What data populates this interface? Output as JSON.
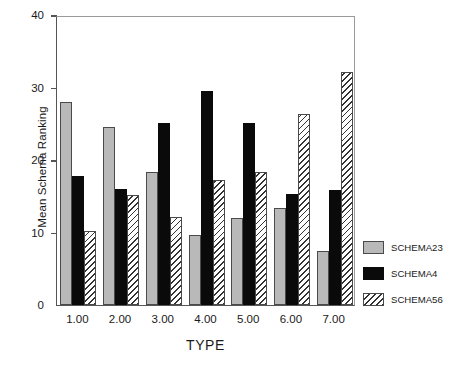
{
  "chart_data": {
    "type": "bar",
    "title": "",
    "xlabel": "TYPE",
    "ylabel": "Mean Schema Ranking",
    "categories": [
      "1.00",
      "2.00",
      "3.00",
      "4.00",
      "5.00",
      "6.00",
      "7.00"
    ],
    "ylim": [
      0,
      40
    ],
    "yticks": [
      0,
      10,
      20,
      30,
      40
    ],
    "ytick_labels": [
      "0",
      "10",
      "20",
      "30",
      "40"
    ],
    "grid": false,
    "legend_position": "right",
    "series": [
      {
        "name": "SCHEMA23",
        "color": "#b9b9b9",
        "fill": "solid-gray",
        "values": [
          28.0,
          24.6,
          18.3,
          9.6,
          12.0,
          13.4,
          7.4
        ]
      },
      {
        "name": "SCHEMA4",
        "color": "#0a0a0a",
        "fill": "solid-black",
        "values": [
          17.8,
          16.0,
          25.1,
          29.5,
          25.1,
          15.3,
          15.8
        ]
      },
      {
        "name": "SCHEMA56",
        "color": "#ffffff",
        "fill": "diagonal-hatch",
        "values": [
          10.2,
          15.2,
          12.2,
          17.2,
          18.4,
          26.4,
          32.1
        ]
      }
    ]
  },
  "legend": {
    "items": [
      {
        "label": "SCHEMA23"
      },
      {
        "label": "SCHEMA4"
      },
      {
        "label": "SCHEMA56"
      }
    ]
  }
}
